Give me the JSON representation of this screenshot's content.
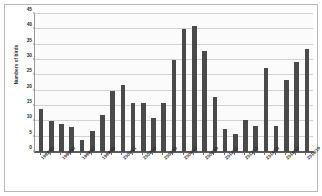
{
  "chart_data": {
    "type": "bar",
    "title": "",
    "xlabel": "",
    "ylabel": "Numbers of birds",
    "ylim": [
      0,
      45
    ],
    "ytick_step": 5,
    "yticks": [
      0,
      5,
      10,
      15,
      20,
      25,
      30,
      35,
      40,
      45
    ],
    "grid": true,
    "legend": "none",
    "bar_color": "#4a4a4a",
    "plot_background": "#fbfbfb",
    "gridline_color": "#d2d2d2",
    "categories": [
      "1992/93",
      "1993/94",
      "1994/95",
      "1995/96",
      "1996/97",
      "1997/98",
      "1998/99",
      "1999/00",
      "2000/01",
      "2001/02",
      "2002/03",
      "2003/04",
      "2004/05",
      "2005/06",
      "2006/07",
      "2007/08",
      "2008/09",
      "2009/10",
      "2010/11",
      "2011/12",
      "2012/13",
      "2013/14",
      "2014/15",
      "2015/16",
      "2016/17",
      "2017/18",
      "2018/19"
    ],
    "visible_tick_labels": [
      "1992/93",
      "",
      "1994/95",
      "",
      "1996/97",
      "",
      "1998/99",
      "",
      "2000/01",
      "",
      "2002/03",
      "",
      "2004/05",
      "",
      "2006/07",
      "",
      "2008/09",
      "",
      "2010/11",
      "",
      "2012/13",
      "",
      "2014/15",
      "",
      "2016/17",
      "",
      "2018/19"
    ],
    "values": [
      14,
      10,
      9,
      8,
      4,
      7,
      12,
      20,
      22,
      16,
      16,
      11,
      16,
      30,
      40,
      41,
      33,
      18,
      7.5,
      6,
      10.5,
      8.5,
      27.5,
      8.5,
      23.5,
      29.5,
      33.5
    ]
  }
}
